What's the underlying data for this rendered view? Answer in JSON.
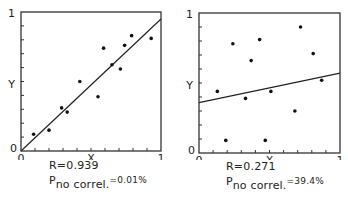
{
  "chart_data": [
    {
      "type": "scatter",
      "title": "",
      "xlabel": "X",
      "ylabel": "Y",
      "xlim": [
        0,
        1
      ],
      "ylim": [
        0,
        1
      ],
      "x_ticks": [
        "0",
        "1"
      ],
      "y_ticks": [
        "0",
        "1"
      ],
      "grid": false,
      "legend": null,
      "points": [
        {
          "x": 0.09,
          "y": 0.12
        },
        {
          "x": 0.2,
          "y": 0.15
        },
        {
          "x": 0.29,
          "y": 0.31
        },
        {
          "x": 0.33,
          "y": 0.28
        },
        {
          "x": 0.42,
          "y": 0.5
        },
        {
          "x": 0.55,
          "y": 0.39
        },
        {
          "x": 0.59,
          "y": 0.74
        },
        {
          "x": 0.65,
          "y": 0.62
        },
        {
          "x": 0.71,
          "y": 0.59
        },
        {
          "x": 0.74,
          "y": 0.76
        },
        {
          "x": 0.79,
          "y": 0.83
        },
        {
          "x": 0.93,
          "y": 0.81
        }
      ],
      "regression_line": {
        "x": [
          0,
          1
        ],
        "y": [
          0.0,
          0.95
        ]
      },
      "annotations": {
        "r": "R=0.939",
        "p_prefix": "P",
        "p_sub": "no correl.",
        "p_value": "=0.01%"
      }
    },
    {
      "type": "scatter",
      "title": "",
      "xlabel": "X",
      "ylabel": "Y",
      "xlim": [
        0,
        1
      ],
      "ylim": [
        0,
        1
      ],
      "x_ticks": [
        "0",
        "1"
      ],
      "y_ticks": [
        "0",
        "1"
      ],
      "grid": false,
      "legend": null,
      "points": [
        {
          "x": 0.13,
          "y": 0.44
        },
        {
          "x": 0.19,
          "y": 0.09
        },
        {
          "x": 0.24,
          "y": 0.78
        },
        {
          "x": 0.33,
          "y": 0.39
        },
        {
          "x": 0.37,
          "y": 0.66
        },
        {
          "x": 0.43,
          "y": 0.81
        },
        {
          "x": 0.47,
          "y": 0.09
        },
        {
          "x": 0.51,
          "y": 0.44
        },
        {
          "x": 0.68,
          "y": 0.3
        },
        {
          "x": 0.72,
          "y": 0.9
        },
        {
          "x": 0.81,
          "y": 0.71
        },
        {
          "x": 0.87,
          "y": 0.52
        }
      ],
      "regression_line": {
        "x": [
          0,
          1
        ],
        "y": [
          0.36,
          0.57
        ]
      },
      "annotations": {
        "r": "R=0.271",
        "p_prefix": "P",
        "p_sub": "no correl.",
        "p_value": "=39.4%"
      }
    }
  ],
  "panels": [
    {
      "r": "R=0.939",
      "p_prefix": "P",
      "p_sub": "no correl.",
      "p_value": "=0.01%",
      "x_label": "X",
      "y_label": "Y",
      "x0": "0",
      "x1": "1",
      "y0": "0",
      "y1": "1"
    },
    {
      "r": "R=0.271",
      "p_prefix": "P",
      "p_sub": "no correl.",
      "p_value": "=39.4%",
      "x_label": "X",
      "y_label": "Y",
      "x0": "0",
      "x1": "1",
      "y0": "0",
      "y1": "1"
    }
  ]
}
